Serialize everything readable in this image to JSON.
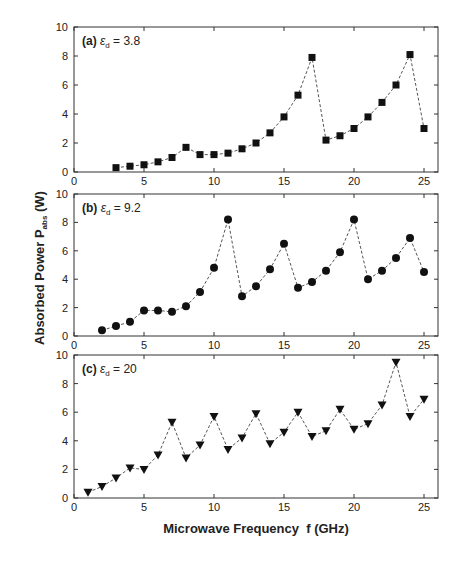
{
  "figure": {
    "ylabel_main": "Absorbed Power P",
    "ylabel_sub": "abs",
    "ylabel_unit": " (W)",
    "xlabel": "Microwave Frequency  f (GHz)"
  },
  "chart_data": [
    {
      "type": "line",
      "panel": "(a)",
      "title": "(a) εd = 3.8",
      "label_prefix": "(a) ",
      "label_eps": "ε",
      "label_sub": "d",
      "label_value": " = 3.8",
      "marker": "square",
      "line_style": "dashed",
      "xlabel": "Microwave Frequency f (GHz)",
      "ylabel": "Absorbed Power Pabs (W)",
      "xlim": [
        0,
        26
      ],
      "ylim": [
        0,
        10
      ],
      "xticks": [
        0,
        5,
        10,
        15,
        20,
        25
      ],
      "yticks": [
        0,
        2,
        4,
        6,
        8,
        10
      ],
      "grid": false,
      "x": [
        3,
        4,
        5,
        6,
        7,
        8,
        9,
        10,
        11,
        12,
        13,
        14,
        15,
        16,
        17,
        18,
        19,
        20,
        21,
        22,
        23,
        24,
        25
      ],
      "y": [
        0.3,
        0.4,
        0.5,
        0.7,
        1.0,
        1.7,
        1.2,
        1.2,
        1.3,
        1.6,
        2.0,
        2.7,
        3.8,
        5.3,
        7.9,
        2.2,
        2.5,
        3.0,
        3.8,
        4.8,
        6.0,
        8.1,
        3.0
      ]
    },
    {
      "type": "line",
      "panel": "(b)",
      "title": "(b) εd = 9.2",
      "label_prefix": "(b) ",
      "label_eps": "ε",
      "label_sub": "d",
      "label_value": " = 9.2",
      "marker": "circle",
      "line_style": "dashed",
      "xlabel": "Microwave Frequency f (GHz)",
      "ylabel": "Absorbed Power Pabs (W)",
      "xlim": [
        0,
        26
      ],
      "ylim": [
        0,
        10
      ],
      "xticks": [
        0,
        5,
        10,
        15,
        20,
        25
      ],
      "yticks": [
        0,
        2,
        4,
        6,
        8,
        10
      ],
      "grid": false,
      "x": [
        2,
        3,
        4,
        5,
        6,
        7,
        8,
        9,
        10,
        11,
        12,
        13,
        14,
        15,
        16,
        17,
        18,
        19,
        20,
        21,
        22,
        23,
        24,
        25
      ],
      "y": [
        0.4,
        0.7,
        1.0,
        1.8,
        1.8,
        1.7,
        2.1,
        3.1,
        4.8,
        8.2,
        2.8,
        3.5,
        4.7,
        6.5,
        3.4,
        3.8,
        4.6,
        5.9,
        8.2,
        4.0,
        4.6,
        5.5,
        6.9,
        4.5
      ]
    },
    {
      "type": "line",
      "panel": "(c)",
      "title": "(c) εd = 20",
      "label_prefix": "(c) ",
      "label_eps": "ε",
      "label_sub": "d",
      "label_value": " = 20",
      "marker": "triangle-down",
      "line_style": "dashed",
      "xlabel": "Microwave Frequency f (GHz)",
      "ylabel": "Absorbed Power Pabs (W)",
      "xlim": [
        0,
        26
      ],
      "ylim": [
        0,
        10
      ],
      "xticks": [
        0,
        5,
        10,
        15,
        20,
        25
      ],
      "yticks": [
        0,
        2,
        4,
        6,
        8,
        10
      ],
      "grid": false,
      "x": [
        1,
        2,
        3,
        4,
        5,
        6,
        7,
        8,
        9,
        10,
        11,
        12,
        13,
        14,
        15,
        16,
        17,
        18,
        19,
        20,
        21,
        22,
        23,
        24,
        25
      ],
      "y": [
        0.4,
        0.8,
        1.4,
        2.1,
        2.0,
        3.0,
        5.3,
        2.8,
        3.7,
        5.7,
        3.4,
        4.2,
        5.9,
        3.8,
        4.6,
        6.0,
        4.3,
        4.7,
        6.2,
        4.8,
        5.2,
        6.5,
        9.5,
        5.7,
        6.9
      ]
    }
  ],
  "style": {
    "axis_color": "#333333",
    "line_color": "#555555",
    "marker_color": "#111111",
    "text_color": "#222222"
  }
}
